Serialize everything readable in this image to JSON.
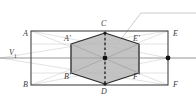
{
  "figure": {
    "canvas": {
      "width": 196,
      "height": 106
    },
    "colors": {
      "outline": "#444444",
      "hexagon_stroke": "#2b2b2b",
      "hexagon_fill": "#b9b9b9",
      "construction_line": "#c9c9c9",
      "axis_line": "#8a8a8a",
      "leader_line": "#bdbdbd",
      "dot": "#111111",
      "label_text": "#3a3a3a",
      "background": "#ffffff"
    },
    "rectangle": {
      "name": "projection-rectangle",
      "left": 31,
      "right": 168,
      "top": 31,
      "bottom": 85
    },
    "axis": {
      "name": "ground-line-v1",
      "y": 58,
      "x_start": 0,
      "x_end": 196
    },
    "hexagon": {
      "name": "hexagon-cross-section",
      "vertices": [
        {
          "id": "Cv",
          "x": 105,
          "y": 33
        },
        {
          "id": "E'",
          "x": 139,
          "y": 44
        },
        {
          "id": "F'",
          "x": 139,
          "y": 73
        },
        {
          "id": "Dv",
          "x": 105,
          "y": 84
        },
        {
          "id": "B'",
          "x": 71,
          "y": 73
        },
        {
          "id": "A'",
          "x": 71,
          "y": 44
        }
      ]
    },
    "center_point": {
      "name": "hexagon-center",
      "x": 105,
      "y": 58
    },
    "right_point": {
      "name": "right-vanishing-point",
      "x": 168,
      "y": 58
    },
    "dashed_axis": {
      "name": "vertical-dashed-axis",
      "x": 105,
      "y_top": 33,
      "y_bottom": 84
    },
    "leader": {
      "name": "callout-leader-line",
      "points": "118,43 141,13 196,13"
    },
    "construction_lines": [
      {
        "name": "diag-a-to-f",
        "x1": 31,
        "y1": 31,
        "x2": 168,
        "y2": 85
      },
      {
        "name": "diag-b-to-e",
        "x1": 31,
        "y1": 85,
        "x2": 168,
        "y2": 31
      },
      {
        "name": "chord-a-center",
        "x1": 31,
        "y1": 31,
        "x2": 168,
        "y2": 58
      },
      {
        "name": "chord-b-center",
        "x1": 31,
        "y1": 85,
        "x2": 168,
        "y2": 58
      },
      {
        "name": "chord-center-e",
        "x1": 0,
        "y1": 58,
        "x2": 168,
        "y2": 31
      },
      {
        "name": "chord-center-f",
        "x1": 0,
        "y1": 58,
        "x2": 168,
        "y2": 85
      },
      {
        "name": "hex-diag-a-f",
        "x1": 71,
        "y1": 44,
        "x2": 139,
        "y2": 73
      },
      {
        "name": "hex-diag-b-e",
        "x1": 71,
        "y1": 73,
        "x2": 139,
        "y2": 44
      },
      {
        "name": "hex-diag-c-d",
        "x1": 105,
        "y1": 33,
        "x2": 105,
        "y2": 84
      },
      {
        "name": "hex-span-left",
        "x1": 71,
        "y1": 44,
        "x2": 71,
        "y2": 73
      },
      {
        "name": "hex-span-right",
        "x1": 139,
        "y1": 44,
        "x2": 139,
        "y2": 73
      },
      {
        "name": "upper-band",
        "x1": 31,
        "y1": 44,
        "x2": 168,
        "y2": 44
      },
      {
        "name": "lower-band",
        "x1": 31,
        "y1": 73,
        "x2": 168,
        "y2": 73
      }
    ],
    "labels": [
      {
        "name": "label-A",
        "text": "A",
        "x": 23,
        "y": 30,
        "sub": ""
      },
      {
        "name": "label-V1",
        "text": "V",
        "x": 9,
        "y": 49,
        "sub": "1"
      },
      {
        "name": "label-B",
        "text": "B",
        "x": 23,
        "y": 81,
        "sub": ""
      },
      {
        "name": "label-E",
        "text": "E",
        "x": 173,
        "y": 30,
        "sub": ""
      },
      {
        "name": "label-F",
        "text": "F",
        "x": 173,
        "y": 81,
        "sub": ""
      },
      {
        "name": "label-C",
        "text": "C",
        "x": 101,
        "y": 20,
        "sub": ""
      },
      {
        "name": "label-D",
        "text": "D",
        "x": 101,
        "y": 88,
        "sub": ""
      },
      {
        "name": "label-Ap",
        "text": "A'",
        "x": 64,
        "y": 35,
        "sub": ""
      },
      {
        "name": "label-Ep",
        "text": "E'",
        "x": 133,
        "y": 35,
        "sub": ""
      },
      {
        "name": "label-Bp",
        "text": "B'",
        "x": 64,
        "y": 73,
        "sub": ""
      },
      {
        "name": "label-Fp",
        "text": "F'",
        "x": 133,
        "y": 73,
        "sub": ""
      }
    ]
  }
}
